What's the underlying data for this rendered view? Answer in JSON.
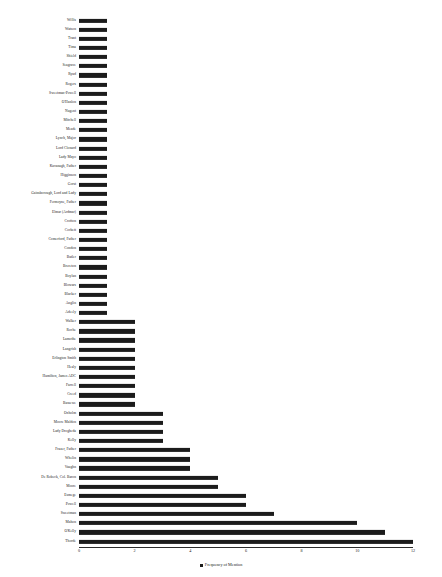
{
  "chart_data": {
    "type": "bar",
    "orientation": "horizontal",
    "title": "",
    "xlabel": "",
    "ylabel": "",
    "xlim": [
      0,
      12
    ],
    "xticks": [
      0,
      2,
      4,
      6,
      8,
      10,
      12
    ],
    "grid": false,
    "legend": {
      "position": "bottom",
      "entries": [
        "Frequency of Mention"
      ]
    },
    "series_name": "Frequency of Mention",
    "bar_color": "#1c1c1c",
    "categories": [
      "Willis",
      "Watson",
      "Trant",
      "Tima",
      "Shield",
      "Seagrave",
      "Ryud",
      "Rogers",
      "Sweetman-Powell",
      "O'Hanlon",
      "Nugent",
      "Mitchell",
      "Meade",
      "Lynch, Major",
      "Lord Clonard",
      "Lady Mayo",
      "Kavanagh, Father",
      "Higginson",
      "Gorst",
      "Gainsborough, Lord and Lady",
      "Fermoyne, Father",
      "Elmar (Ardmar)",
      "Crofton",
      "Corbett",
      "Comerford, Father",
      "Condon",
      "Butler",
      "Brereton",
      "Boylan",
      "Blowars",
      "Blacker",
      "Anglin",
      "Adeely",
      "Walker",
      "Roche",
      "Lamothe",
      "Langrish",
      "Erlington Smith",
      "Healy",
      "Hamilton, James ADC",
      "Farrell",
      "Creed",
      "Bassewe",
      "Oxholm",
      "Moore Maldon",
      "Lady Drogheda",
      "Kelly",
      "Frazer, Father",
      "Whelin",
      "Vaughn",
      "De Robeck, Col. Baron",
      "Moore",
      "Esmege",
      "Powell",
      "Sweetman",
      "Mahon",
      "O'Kelly",
      "Thorde"
    ],
    "values": [
      1,
      1,
      1,
      1,
      1,
      1,
      1,
      1,
      1,
      1,
      1,
      1,
      1,
      1,
      1,
      1,
      1,
      1,
      1,
      1,
      1,
      1,
      1,
      1,
      1,
      1,
      1,
      1,
      1,
      1,
      1,
      1,
      1,
      2,
      2,
      2,
      2,
      2,
      2,
      2,
      2,
      2,
      2,
      3,
      3,
      3,
      3,
      4,
      4,
      4,
      5,
      5,
      6,
      6,
      7,
      10,
      11,
      12
    ]
  }
}
